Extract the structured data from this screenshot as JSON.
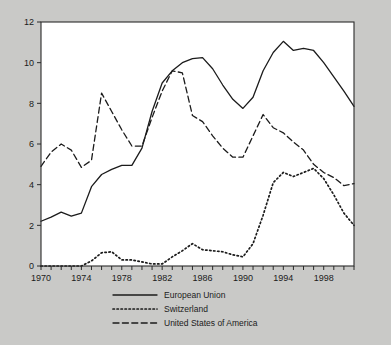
{
  "chart_data": {
    "type": "line",
    "title": "",
    "subtitle": "",
    "xlabel": "",
    "ylabel": "",
    "xlim": [
      1970,
      2001
    ],
    "ylim": [
      0,
      12
    ],
    "ytick_step": 2,
    "yticks": [
      "0",
      "2",
      "4",
      "6",
      "8",
      "10",
      "12"
    ],
    "xticks_all": [
      1970,
      1971,
      1972,
      1973,
      1974,
      1975,
      1976,
      1977,
      1978,
      1979,
      1980,
      1981,
      1982,
      1983,
      1984,
      1985,
      1986,
      1987,
      1988,
      1989,
      1990,
      1991,
      1992,
      1993,
      1994,
      1995,
      1996,
      1997,
      1998,
      1999,
      2000,
      2001
    ],
    "xtick_labels": [
      "1970",
      "1974",
      "1978",
      "1982",
      "1986",
      "1990",
      "1994",
      "1998"
    ],
    "xtick_label_values": [
      1970,
      1974,
      1978,
      1982,
      1986,
      1990,
      1994,
      1998
    ],
    "grid": false,
    "legend_position": "bottom",
    "x": [
      1970,
      1971,
      1972,
      1973,
      1974,
      1975,
      1976,
      1977,
      1978,
      1979,
      1980,
      1981,
      1982,
      1983,
      1984,
      1985,
      1986,
      1987,
      1988,
      1989,
      1990,
      1991,
      1992,
      1993,
      1994,
      1995,
      1996,
      1997,
      1998,
      1999,
      2000,
      2001
    ],
    "series": [
      {
        "name": "European Union",
        "style": "solid",
        "color": "#1b1b1b",
        "values": [
          2.2,
          2.4,
          2.65,
          2.45,
          2.6,
          3.9,
          4.5,
          4.75,
          4.95,
          4.95,
          5.8,
          7.6,
          9.0,
          9.6,
          10.0,
          10.2,
          10.25,
          9.7,
          8.9,
          8.2,
          7.75,
          8.3,
          9.6,
          10.5,
          11.05,
          10.6,
          10.7,
          10.6,
          10.0,
          9.3,
          8.6,
          7.85
        ]
      },
      {
        "name": "Switzerland",
        "style": "dotted",
        "color": "#1b1b1b",
        "values": [
          0.0,
          0.0,
          0.0,
          0.0,
          0.0,
          0.25,
          0.65,
          0.7,
          0.3,
          0.3,
          0.2,
          0.1,
          0.1,
          0.45,
          0.75,
          1.1,
          0.8,
          0.75,
          0.7,
          0.55,
          0.45,
          1.1,
          2.5,
          4.1,
          4.6,
          4.4,
          4.6,
          4.8,
          4.3,
          3.5,
          2.6,
          2.0
        ]
      },
      {
        "name": "United States of America",
        "style": "dashed",
        "color": "#1b1b1b",
        "values": [
          4.9,
          5.6,
          6.0,
          5.7,
          4.85,
          5.2,
          8.5,
          7.6,
          6.7,
          5.9,
          5.9,
          7.3,
          8.6,
          9.6,
          9.5,
          7.4,
          7.1,
          6.4,
          5.8,
          5.35,
          5.35,
          6.4,
          7.45,
          6.8,
          6.55,
          6.1,
          5.7,
          5.0,
          4.6,
          4.35,
          3.95,
          4.05
        ]
      }
    ]
  },
  "legend": {
    "items": [
      {
        "label": "European Union",
        "style": "solid"
      },
      {
        "label": "Switzerland",
        "style": "dotted"
      },
      {
        "label": "United States of America",
        "style": "dashed"
      }
    ]
  }
}
